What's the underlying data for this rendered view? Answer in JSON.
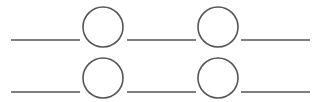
{
  "diagram": {
    "width": 320,
    "height": 102,
    "stroke_color": "#555555",
    "stroke_width": 1.6,
    "rows": [
      {
        "line_y": 40,
        "segments": [
          [
            11,
            80
          ],
          [
            127,
            196
          ],
          [
            241,
            310
          ]
        ],
        "circles": [
          {
            "cx": 103,
            "cy": 27,
            "r": 20
          },
          {
            "cx": 218,
            "cy": 27,
            "r": 20
          }
        ]
      },
      {
        "line_y": 92,
        "segments": [
          [
            11,
            80
          ],
          [
            127,
            196
          ],
          [
            241,
            310
          ]
        ],
        "circles": [
          {
            "cx": 103,
            "cy": 78,
            "r": 20
          },
          {
            "cx": 218,
            "cy": 78,
            "r": 20
          }
        ]
      }
    ]
  }
}
